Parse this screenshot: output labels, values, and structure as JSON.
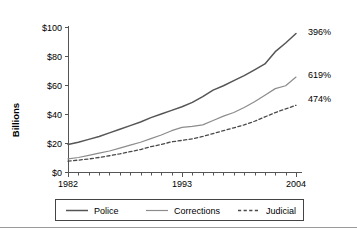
{
  "chart_data": {
    "type": "line",
    "title": "",
    "xlabel": "",
    "ylabel": "Billions",
    "xlim": [
      1982,
      2004
    ],
    "ylim": [
      0,
      100
    ],
    "grid": false,
    "legend_position": "bottom",
    "x": [
      1982,
      1983,
      1984,
      1985,
      1986,
      1987,
      1988,
      1989,
      1990,
      1991,
      1992,
      1993,
      1994,
      1995,
      1996,
      1997,
      1998,
      1999,
      2000,
      2001,
      2002,
      2003,
      2004
    ],
    "x_tick_labels": [
      "1982",
      "1993",
      "2004"
    ],
    "x_tick_values": [
      1982,
      1993,
      2004
    ],
    "y_tick_labels": [
      "$0",
      "$20",
      "$40",
      "$60",
      "$80",
      "$100"
    ],
    "y_tick_values": [
      0,
      20,
      40,
      60,
      80,
      100
    ],
    "series": [
      {
        "name": "Police",
        "style": "solid",
        "color": "#555555",
        "width": 1.5,
        "end_label": "396%",
        "values": [
          19.0,
          20.5,
          22.5,
          24.5,
          27.0,
          29.5,
          32.0,
          34.5,
          37.5,
          40.0,
          42.5,
          45.0,
          48.0,
          52.0,
          56.5,
          59.5,
          63.0,
          66.5,
          70.5,
          74.5,
          83.0,
          89.0,
          95.5
        ]
      },
      {
        "name": "Corrections",
        "style": "solid",
        "color": "#8c8c8c",
        "width": 1.2,
        "end_label": "619%",
        "values": [
          9.0,
          10.0,
          11.5,
          13.0,
          14.5,
          16.5,
          18.5,
          20.5,
          23.0,
          25.5,
          28.5,
          30.8,
          31.5,
          32.5,
          35.5,
          38.5,
          41.0,
          44.5,
          48.5,
          53.0,
          57.5,
          59.5,
          65.5
        ]
      },
      {
        "name": "Judicial",
        "style": "dashed",
        "color": "#4a4a4a",
        "width": 1.3,
        "end_label": "474%",
        "values": [
          7.5,
          8.2,
          9.0,
          10.0,
          11.2,
          12.5,
          14.0,
          15.5,
          17.5,
          19.0,
          20.8,
          21.8,
          22.8,
          24.5,
          26.5,
          28.5,
          30.5,
          32.5,
          35.0,
          38.0,
          41.0,
          43.5,
          46.0
        ]
      }
    ]
  },
  "legend": {
    "items": [
      {
        "label": "Police"
      },
      {
        "label": "Corrections"
      },
      {
        "label": "Judicial"
      }
    ]
  }
}
